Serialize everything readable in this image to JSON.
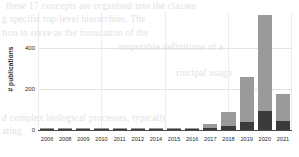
{
  "chart_data": {
    "type": "bar",
    "stacked": true,
    "title": "",
    "xlabel": "",
    "ylabel": "# publications",
    "categories": [
      "2006",
      "2008",
      "2009",
      "2010",
      "2011",
      "2012",
      "2014",
      "2015",
      "2016",
      "2017",
      "2018",
      "2019",
      "2020",
      "2021"
    ],
    "series": [
      {
        "name": "segment-dark",
        "color": "#3b3b3b",
        "values": [
          1,
          2,
          2,
          3,
          1,
          2,
          3,
          3,
          6,
          9,
          22,
          40,
          93,
          44
        ]
      },
      {
        "name": "segment-light",
        "color": "#9a9a9a",
        "values": [
          1,
          2,
          3,
          3,
          1,
          2,
          3,
          3,
          6,
          21,
          66,
          218,
          467,
          132
        ]
      }
    ],
    "totals": [
      2,
      4,
      5,
      6,
      2,
      4,
      6,
      6,
      12,
      30,
      88,
      258,
      560,
      176
    ],
    "yticks": [
      0,
      200,
      400
    ],
    "ylim": [
      0,
      575
    ],
    "grid": true,
    "legend": "none"
  },
  "background_text": {
    "lines": [
      "these 17 concepts are organised into the classes",
      "g specific top-level hierarchies. The",
      "tion to serve as the foundation of the",
      "omputable definitions of a",
      "rincipal usage",
      "d complex biological processes, typically",
      "ating"
    ]
  }
}
